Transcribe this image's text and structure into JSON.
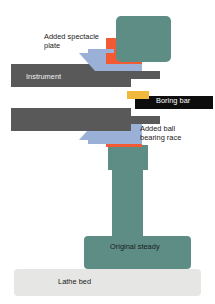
{
  "diagram": {
    "background_color": "#ffffff",
    "labels": {
      "spectacle_plate": "Added spectacle\nplate",
      "instrument": "Instrument",
      "boring_bar": "Boring bar",
      "ball_bearing_race": "Added ball\nbearing race",
      "original_steady": "Original steady",
      "lathe_bed": "Lathe bed"
    },
    "colors": {
      "teal": "#5e8d85",
      "teal_dark": "#4f7f77",
      "red": "#f15a33",
      "blue": "#9bb0d6",
      "gray_dark": "#595959",
      "black": "#0d0d0d",
      "amber": "#f0b93c",
      "light_gray": "#e6e6e4",
      "text_dark": "#1a1a1a",
      "text_light": "#f2f2f2",
      "text_white": "#ffffff"
    },
    "parts": [
      {
        "name": "upper-teal-body",
        "color": "#5e8d85",
        "shape": "rounded-rect"
      },
      {
        "name": "upper-bearing-race",
        "color": "#f15a33",
        "shape": "i-beam"
      },
      {
        "name": "upper-spectacle-plate",
        "color": "#9bb0d6",
        "shape": "wedge"
      },
      {
        "name": "upper-instrument-bar",
        "color": "#595959",
        "shape": "stepped-bar"
      },
      {
        "name": "boring-bar",
        "color": "#0d0d0d",
        "shape": "bar"
      },
      {
        "name": "boring-bar-tool-tip",
        "color": "#f0b93c",
        "shape": "bar"
      },
      {
        "name": "lower-instrument-bar",
        "color": "#595959",
        "shape": "stepped-bar"
      },
      {
        "name": "lower-spectacle-plate",
        "color": "#9bb0d6",
        "shape": "wedge"
      },
      {
        "name": "lower-bearing-race",
        "color": "#f15a33",
        "shape": "i-beam"
      },
      {
        "name": "steady-column",
        "color": "#5e8d85",
        "shape": "column"
      },
      {
        "name": "steady-base",
        "color": "#5e8d85",
        "shape": "rounded-rect"
      },
      {
        "name": "lathe-bed",
        "color": "#e6e6e4",
        "shape": "rounded-rect"
      }
    ]
  }
}
